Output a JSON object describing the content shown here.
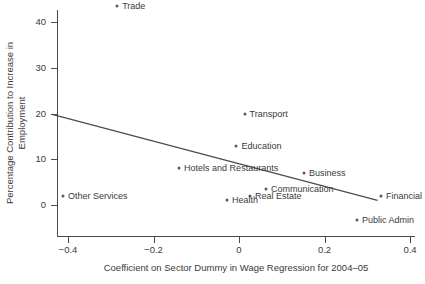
{
  "chart_data": {
    "type": "scatter",
    "title": "",
    "xlabel": "Coefficient on Sector Dummy in Wage Regression for 2004–05",
    "ylabel": "Percentage Contribution to Increase in Employment",
    "ylabel_line1": "Percentage Contribution to Increase in",
    "ylabel_line2": "Employment",
    "xlim": [
      -0.44,
      0.42
    ],
    "ylim": [
      -5.0,
      45.0
    ],
    "xticks": [
      -0.4,
      -0.2,
      0,
      0.2,
      0.4
    ],
    "xtick_labels": [
      "−0.4",
      "−0.2",
      "0",
      "0.2",
      "0.4"
    ],
    "yticks": [
      0,
      10,
      20,
      30,
      40
    ],
    "ytick_labels": [
      "0",
      "10",
      "20",
      "30",
      "40"
    ],
    "grid": false,
    "legend": "none",
    "marker_color": "#595959",
    "line_color": "#4a4a4a",
    "axis_color": "#4a4a4a",
    "points": [
      {
        "label": "Trade",
        "x": -0.285,
        "y": 43.4,
        "label_pos": "right"
      },
      {
        "label": "Transport",
        "x": 0.013,
        "y": 20.0,
        "label_pos": "right"
      },
      {
        "label": "Education",
        "x": -0.006,
        "y": 13.0,
        "label_pos": "right"
      },
      {
        "label": "Hotels and Restaurants",
        "x": -0.14,
        "y": 8.0,
        "label_pos": "right"
      },
      {
        "label": "Business",
        "x": 0.152,
        "y": 7.0,
        "label_pos": "right"
      },
      {
        "label": "Communication",
        "x": 0.063,
        "y": 3.5,
        "label_pos": "right"
      },
      {
        "label": "Other Services",
        "x": -0.412,
        "y": 2.0,
        "label_pos": "right"
      },
      {
        "label": "Real Estate",
        "x": 0.026,
        "y": 2.0,
        "label_pos": "right"
      },
      {
        "label": "Financial",
        "x": 0.332,
        "y": 2.0,
        "label_pos": "right"
      },
      {
        "label": "Health",
        "x": -0.028,
        "y": 1.2,
        "label_pos": "right"
      },
      {
        "label": "Public Admin",
        "x": 0.276,
        "y": -3.3,
        "label_pos": "right"
      }
    ],
    "fit_line": {
      "x_start": -0.437,
      "y_start": 19.8,
      "x_end": 0.324,
      "y_end": 1.0
    }
  }
}
